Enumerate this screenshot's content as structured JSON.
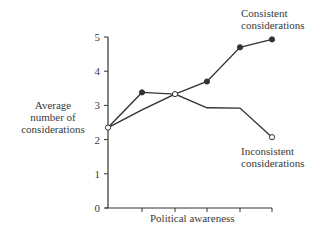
{
  "chart_data": {
    "type": "line",
    "title": "",
    "xlabel": "Political awareness",
    "ylabel": "Average number of considerations",
    "ylabel_lines": [
      "Average",
      "number of",
      "considerations"
    ],
    "ylim": [
      0,
      5
    ],
    "yticks": [
      0,
      1,
      2,
      3,
      4,
      5
    ],
    "x": [
      1,
      2,
      3,
      4,
      5,
      6
    ],
    "xtick_labels": [
      "",
      "",
      "",
      "",
      "",
      ""
    ],
    "grid": false,
    "legend": "inline annotations",
    "series": [
      {
        "name": "Consistent considerations",
        "label_lines": [
          "Consistent",
          "considerations"
        ],
        "marker": "filled-circle",
        "values": [
          2.35,
          3.38,
          3.33,
          3.7,
          4.7,
          4.93
        ]
      },
      {
        "name": "Inconsistent considerations",
        "label_lines": [
          "Inconsistent",
          "considerations"
        ],
        "marker": "open-circle",
        "values": [
          2.35,
          2.87,
          3.33,
          2.93,
          2.92,
          2.07
        ]
      }
    ]
  },
  "colors": {
    "line": "#333333",
    "text": "#3a3a3a",
    "background": "#ffffff"
  }
}
